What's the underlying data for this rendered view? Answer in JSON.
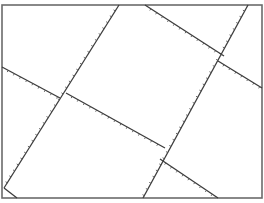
{
  "diagram": {
    "type": "line-drawing",
    "colors": {
      "background": "#ffffff",
      "frame": "#6b6b6b",
      "lines": "#3c3c3c",
      "ticks": "#555555"
    },
    "frame": {
      "x1": 2,
      "y1": 5,
      "x2": 262,
      "y2": 198
    },
    "segments": [
      {
        "id": "steep-left",
        "x1": 119,
        "y1": 5,
        "x2": 4,
        "y2": 188,
        "ticks": true
      },
      {
        "id": "shallow-left-a",
        "x1": 2,
        "y1": 67,
        "x2": 60,
        "y2": 98,
        "ticks": true
      },
      {
        "id": "shallow-left-b",
        "x1": 66,
        "y1": 93,
        "x2": 165,
        "y2": 148,
        "ticks": true
      },
      {
        "id": "shallow-left-c",
        "x1": 160,
        "y1": 159,
        "x2": 218,
        "y2": 198,
        "ticks": true
      },
      {
        "id": "steep-right",
        "x1": 248,
        "y1": 5,
        "x2": 143,
        "y2": 198,
        "ticks": true
      },
      {
        "id": "shallow-right-a",
        "x1": 145,
        "y1": 5,
        "x2": 224,
        "y2": 56,
        "ticks": true
      },
      {
        "id": "shallow-right-b",
        "x1": 218,
        "y1": 61,
        "x2": 262,
        "y2": 88,
        "ticks": true
      },
      {
        "id": "corner-stub",
        "x1": 4,
        "y1": 188,
        "x2": 17,
        "y2": 198,
        "ticks": false
      }
    ]
  }
}
